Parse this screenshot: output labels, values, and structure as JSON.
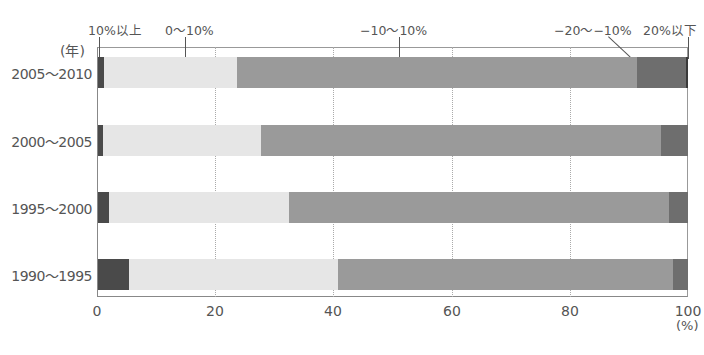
{
  "chart_data": {
    "type": "bar",
    "orientation": "horizontal",
    "stacked": true,
    "title": "",
    "xlabel": "(%)",
    "ylabel": "(年)",
    "xlim": [
      0,
      100
    ],
    "x_ticks": [
      "0",
      "20",
      "40",
      "60",
      "80",
      "100"
    ],
    "grid": "vertical dotted at 20, 40, 60, 80",
    "legend_position": "top, labels with leader lines",
    "categories": [
      "2005～2010",
      "2000～2005",
      "1995～2000",
      "1990～1995"
    ],
    "series": [
      {
        "name": "10%以上",
        "color": "#4a4a4a",
        "values": [
          1.1,
          0.8,
          1.9,
          5.2
        ]
      },
      {
        "name": "0～10%",
        "color": "#e6e6e6",
        "values": [
          22.4,
          26.8,
          30.4,
          35.4
        ]
      },
      {
        "name": "−10～10%",
        "color": "#9a9a9a",
        "values": [
          67.9,
          67.8,
          64.4,
          56.8
        ]
      },
      {
        "name": "−20～−10%",
        "color": "#6e6e6e",
        "values": [
          8.3,
          4.6,
          3.3,
          2.6
        ]
      },
      {
        "name": "20%以下",
        "color": "#3a3a3a",
        "values": [
          0.3,
          0.0,
          0.0,
          0.0
        ]
      }
    ]
  },
  "labels": {
    "y_unit": "(年)",
    "x_unit": "(%)",
    "rows": [
      "2005～2010",
      "2000～2005",
      "1995～2000",
      "1990～1995"
    ],
    "x_ticks": [
      "0",
      "20",
      "40",
      "60",
      "80",
      "100"
    ],
    "legend": [
      "10%以上",
      "0～10%",
      "−10～10%",
      "−20～−10%",
      "20%以下"
    ]
  }
}
